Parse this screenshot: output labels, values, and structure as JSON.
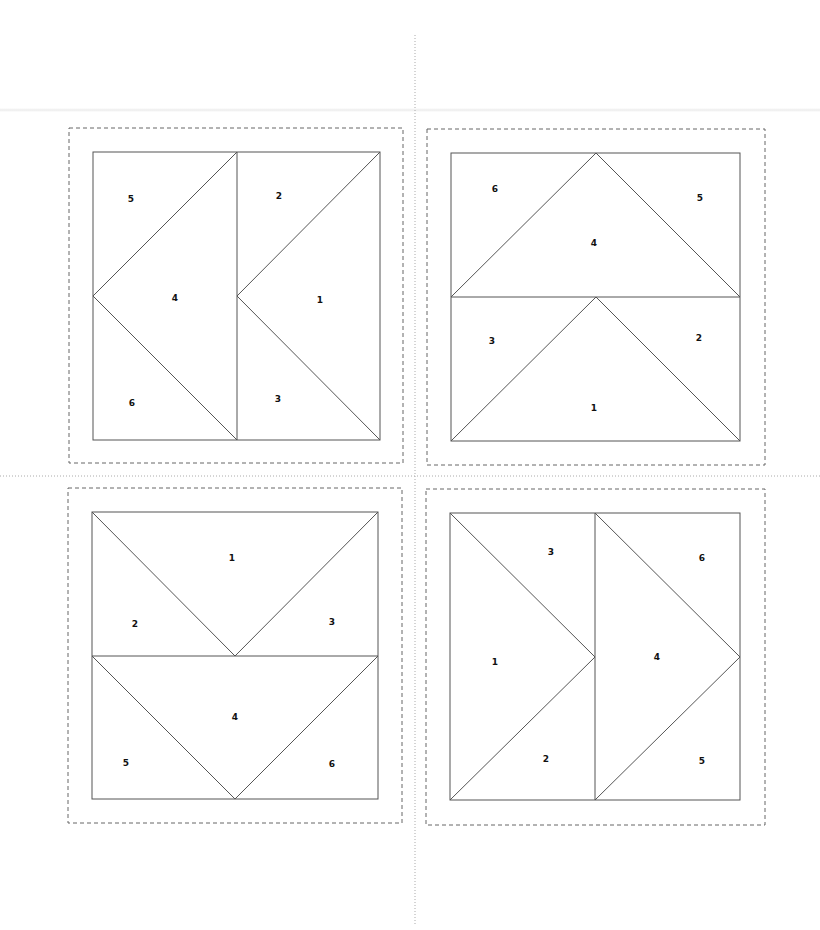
{
  "page": {
    "width": 820,
    "height": 930,
    "line_color": "#555555",
    "dash_color": "#666666",
    "guide_color": "#aaaaaa"
  },
  "guides": {
    "vertical": {
      "x": 415,
      "y1": 35,
      "y2": 925
    },
    "horizontal": {
      "y": 476,
      "x1": 0,
      "x2": 820
    }
  },
  "blocks": [
    {
      "id": "top-left",
      "seam": {
        "x": 69,
        "y": 128,
        "w": 334,
        "h": 335
      },
      "square": {
        "x": 93,
        "y": 152,
        "w": 287,
        "h": 288
      },
      "lines": [
        [
          237,
          152,
          237,
          440
        ],
        [
          93,
          296,
          237,
          152
        ],
        [
          93,
          296,
          237,
          440
        ],
        [
          237,
          296,
          380,
          152
        ],
        [
          237,
          296,
          380,
          440
        ]
      ],
      "labels": [
        {
          "text": "5",
          "x": 131,
          "y": 199
        },
        {
          "text": "2",
          "x": 279,
          "y": 196
        },
        {
          "text": "4",
          "x": 175,
          "y": 298
        },
        {
          "text": "1",
          "x": 320,
          "y": 300
        },
        {
          "text": "6",
          "x": 132,
          "y": 403
        },
        {
          "text": "3",
          "x": 278,
          "y": 399
        }
      ]
    },
    {
      "id": "top-right",
      "seam": {
        "x": 427,
        "y": 129,
        "w": 338,
        "h": 336
      },
      "square": {
        "x": 451,
        "y": 153,
        "w": 289,
        "h": 288
      },
      "lines": [
        [
          451,
          297,
          740,
          297
        ],
        [
          451,
          297,
          596,
          153
        ],
        [
          596,
          153,
          740,
          297
        ],
        [
          451,
          441,
          596,
          297
        ],
        [
          596,
          297,
          740,
          441
        ]
      ],
      "labels": [
        {
          "text": "6",
          "x": 495,
          "y": 189
        },
        {
          "text": "5",
          "x": 700,
          "y": 198
        },
        {
          "text": "4",
          "x": 594,
          "y": 243
        },
        {
          "text": "3",
          "x": 492,
          "y": 341
        },
        {
          "text": "2",
          "x": 699,
          "y": 338
        },
        {
          "text": "1",
          "x": 594,
          "y": 408
        }
      ]
    },
    {
      "id": "bottom-left",
      "seam": {
        "x": 68,
        "y": 488,
        "w": 334,
        "h": 335
      },
      "square": {
        "x": 92,
        "y": 512,
        "w": 286,
        "h": 287
      },
      "lines": [
        [
          92,
          656,
          378,
          656
        ],
        [
          92,
          512,
          235,
          656
        ],
        [
          235,
          656,
          378,
          512
        ],
        [
          92,
          656,
          235,
          799
        ],
        [
          235,
          799,
          378,
          656
        ]
      ],
      "labels": [
        {
          "text": "1",
          "x": 232,
          "y": 558
        },
        {
          "text": "2",
          "x": 135,
          "y": 624
        },
        {
          "text": "3",
          "x": 332,
          "y": 622
        },
        {
          "text": "4",
          "x": 235,
          "y": 717
        },
        {
          "text": "5",
          "x": 126,
          "y": 763
        },
        {
          "text": "6",
          "x": 332,
          "y": 764
        }
      ]
    },
    {
      "id": "bottom-right",
      "seam": {
        "x": 426,
        "y": 489,
        "w": 339,
        "h": 336
      },
      "square": {
        "x": 450,
        "y": 513,
        "w": 290,
        "h": 287
      },
      "lines": [
        [
          595,
          513,
          595,
          800
        ],
        [
          450,
          513,
          595,
          657
        ],
        [
          450,
          800,
          595,
          657
        ],
        [
          595,
          513,
          740,
          657
        ],
        [
          595,
          800,
          740,
          657
        ]
      ],
      "labels": [
        {
          "text": "3",
          "x": 551,
          "y": 552
        },
        {
          "text": "6",
          "x": 702,
          "y": 558
        },
        {
          "text": "1",
          "x": 495,
          "y": 662
        },
        {
          "text": "4",
          "x": 657,
          "y": 657
        },
        {
          "text": "2",
          "x": 546,
          "y": 759
        },
        {
          "text": "5",
          "x": 702,
          "y": 761
        }
      ]
    }
  ]
}
